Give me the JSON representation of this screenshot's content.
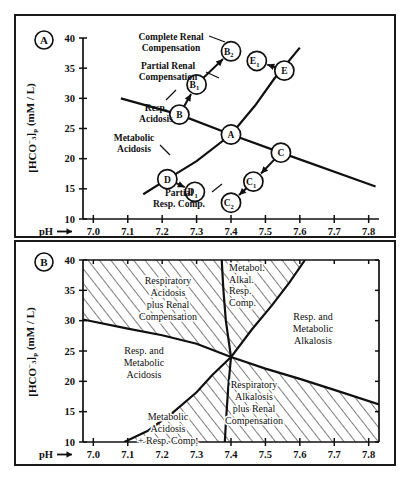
{
  "figure": {
    "panels": [
      {
        "tag": "A",
        "axes": {
          "x_label": "pH",
          "x_arrow": "→",
          "x_ticks": [
            "7.0",
            "7.1",
            "7.2",
            "7.3",
            "7.4",
            "7.5",
            "7.6",
            "7.7",
            "7.8"
          ],
          "x_tick_values": [
            7.0,
            7.1,
            7.2,
            7.3,
            7.4,
            7.5,
            7.6,
            7.7,
            7.8
          ],
          "xlim": [
            6.97,
            7.83
          ],
          "y_label_main": "[HCO",
          "y_label_sub": "3",
          "y_label_sup": "−",
          "y_label_close": "]",
          "y_label_p": "p",
          "y_label_units": "(mM / L)",
          "y_ticks": [
            "10",
            "15",
            "20",
            "25",
            "30",
            "35",
            "40"
          ],
          "y_tick_values": [
            10,
            15,
            20,
            25,
            30,
            35,
            40
          ],
          "ylim": [
            10,
            40
          ]
        },
        "annotations": [
          {
            "id": "ann-complete-renal",
            "lines": [
              "Complete Renal",
              "Compensation"
            ]
          },
          {
            "id": "ann-partial-renal",
            "lines": [
              "Partial Renal",
              "Compensation"
            ]
          },
          {
            "id": "ann-resp-acidosis",
            "lines": [
              "Resp.",
              "Acidosis"
            ]
          },
          {
            "id": "ann-metabolic-acidosis",
            "lines": [
              "Metabolic",
              "Acidosis"
            ]
          },
          {
            "id": "ann-partial-resp-comp",
            "lines": [
              "Partial",
              "Resp. Comp."
            ]
          }
        ],
        "points": [
          {
            "id": "A",
            "label": "A",
            "sub": "",
            "ph": 7.4,
            "hco3": 24.0
          },
          {
            "id": "B",
            "label": "B",
            "sub": "",
            "ph": 7.25,
            "hco3": 27.3
          },
          {
            "id": "B1",
            "label": "B",
            "sub": "1",
            "ph": 7.3,
            "hco3": 32.3
          },
          {
            "id": "B2",
            "label": "B",
            "sub": "2",
            "ph": 7.4,
            "hco3": 37.8
          },
          {
            "id": "C",
            "label": "C",
            "sub": "",
            "ph": 7.545,
            "hco3": 21.0
          },
          {
            "id": "C1",
            "label": "C",
            "sub": "1",
            "ph": 7.465,
            "hco3": 16.2
          },
          {
            "id": "C2",
            "label": "C",
            "sub": "2",
            "ph": 7.4,
            "hco3": 12.7
          },
          {
            "id": "D",
            "label": "D",
            "sub": "",
            "ph": 7.215,
            "hco3": 16.6
          },
          {
            "id": "D1",
            "label": "D",
            "sub": "1",
            "ph": 7.295,
            "hco3": 14.5
          },
          {
            "id": "E",
            "label": "E",
            "sub": "",
            "ph": 7.555,
            "hco3": 34.6
          },
          {
            "id": "E1",
            "label": "E",
            "sub": "1",
            "ph": 7.475,
            "hco3": 36.2
          }
        ],
        "curves": [
          {
            "id": "buffer-line",
            "name": "blood-buffer-line"
          },
          {
            "id": "co2-titration",
            "name": "co2-titration-curve"
          }
        ],
        "arrows": [
          {
            "id": "arrow-B-B1",
            "from": "B",
            "to": "B1"
          },
          {
            "id": "arrow-B1-B2",
            "from": "B1",
            "to": "B2"
          },
          {
            "id": "arrow-C-C1",
            "from": "C",
            "to": "C1"
          },
          {
            "id": "arrow-C1-C2",
            "from": "C1",
            "to": "C2"
          },
          {
            "id": "arrow-D-D1",
            "from": "D",
            "to": "D1"
          },
          {
            "id": "arrow-E-E1",
            "from": "E",
            "to": "E1"
          }
        ]
      },
      {
        "tag": "B",
        "axes": {
          "x_label": "pH",
          "x_arrow": "→",
          "x_ticks": [
            "7.0",
            "7.1",
            "7.2",
            "7.3",
            "7.4",
            "7.5",
            "7.6",
            "7.7",
            "7.8"
          ],
          "x_tick_values": [
            7.0,
            7.1,
            7.2,
            7.3,
            7.4,
            7.5,
            7.6,
            7.7,
            7.8
          ],
          "xlim": [
            6.97,
            7.83
          ],
          "y_label_main": "[HCO",
          "y_label_sub": "3",
          "y_label_sup": "−",
          "y_label_close": "]",
          "y_label_p": "p",
          "y_label_units": "(mM / L)",
          "y_ticks": [
            "10",
            "15",
            "20",
            "25",
            "30",
            "35",
            "40"
          ],
          "y_tick_values": [
            10,
            15,
            20,
            25,
            30,
            35,
            40
          ],
          "ylim": [
            10,
            40
          ]
        },
        "regions": [
          {
            "id": "region-resp-acid-renal",
            "hatched": true,
            "lines": [
              "Respiratory",
              "Acidosis",
              "plus Renal",
              "Compensation"
            ]
          },
          {
            "id": "region-metabol-alkal",
            "hatched": true,
            "lines": [
              "Metabol.",
              "Alkal.",
              "Resp.",
              "Comp."
            ]
          },
          {
            "id": "region-resp-met-alkal",
            "hatched": false,
            "lines": [
              "Resp. and",
              "Metabolic",
              "Alkalosis"
            ]
          },
          {
            "id": "region-resp-met-acid",
            "hatched": false,
            "lines": [
              "Resp. and",
              "Metabolic",
              "Acidosis"
            ]
          },
          {
            "id": "region-resp-alkal-renal",
            "hatched": true,
            "lines": [
              "Respiratory",
              "Alkalosis",
              "plus Renal",
              "Compensation"
            ]
          },
          {
            "id": "region-metab-acid-resp",
            "hatched": true,
            "lines": [
              "Metabolic",
              "Acidosis",
              "+ Resp. Comp."
            ]
          }
        ],
        "center": {
          "ph": 7.4,
          "hco3": 24.0
        }
      }
    ]
  },
  "colors": {
    "ink": "#101010",
    "paper": "#ffffff",
    "frame": "#1a1a1a"
  }
}
